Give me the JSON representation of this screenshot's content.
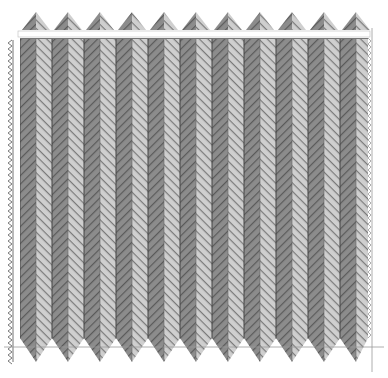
{
  "colors": {
    "background": "#ffffff",
    "dark_strip": "#8c8c8c",
    "dark_strip_line": "#5a5a5a",
    "light_strip": "#c8c8c8",
    "light_strip_line": "#7a7a7a",
    "column_edge": "#444444",
    "guide_line": "#9a9a9a"
  },
  "pattern": {
    "field": {
      "x": 20,
      "y": 38,
      "width": 348,
      "height": 300
    },
    "column_width": 32,
    "columns": 11,
    "stripe_spacing": 6,
    "top_zigzag": {
      "y_base": 30,
      "y_peak": 12,
      "period": 32
    },
    "bottom_zigzag": {
      "y_base": 338,
      "y_peak": 362,
      "period": 32
    },
    "left_sawtooth": {
      "x": 8,
      "y_top": 40,
      "y_bottom": 362
    },
    "white_bar": {
      "y": 31,
      "height": 6
    }
  },
  "guides": {
    "horizontal_y": 347,
    "left_vertical_x": 14,
    "right_vertical_x": 372
  }
}
